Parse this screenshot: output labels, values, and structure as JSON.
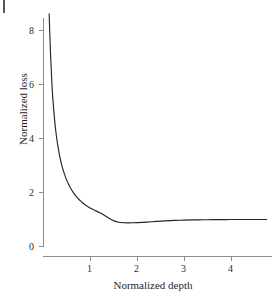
{
  "figure": {
    "background_color": "#ffffff",
    "line_color": "#262626",
    "axis_color": "#8c8c8c",
    "corner_mark_name": "page-margin-mark"
  },
  "chart_data": {
    "type": "line",
    "title": "",
    "xlabel": "Normalized depth",
    "ylabel": "Normalized loss",
    "xlim": [
      0.12,
      4.75
    ],
    "ylim": [
      0,
      9.1
    ],
    "xticks": [
      1,
      2,
      3,
      4
    ],
    "yticks": [
      0,
      2,
      4,
      6,
      8
    ],
    "xtick_labels": [
      "1",
      "2",
      "3",
      "4"
    ],
    "ytick_labels": [
      "0",
      "2",
      "4",
      "6",
      "8"
    ],
    "grid": false,
    "legend": null,
    "series": [
      {
        "name": "normalized loss",
        "x": [
          0.12,
          0.15,
          0.18,
          0.2,
          0.25,
          0.3,
          0.35,
          0.4,
          0.45,
          0.5,
          0.55,
          0.6,
          0.65,
          0.7,
          0.75,
          0.8,
          0.85,
          0.9,
          0.95,
          1.0,
          1.05,
          1.1,
          1.2,
          1.3,
          1.4,
          1.5,
          1.6,
          1.7,
          1.8,
          1.9,
          2.0,
          2.2,
          2.4,
          2.6,
          2.8,
          3.0,
          3.2,
          3.4,
          3.6,
          3.8,
          4.0,
          4.25,
          4.5,
          4.75
        ],
        "y": [
          8.62,
          7.1,
          6.0,
          5.45,
          4.45,
          3.78,
          3.3,
          2.94,
          2.66,
          2.43,
          2.25,
          2.09,
          1.96,
          1.85,
          1.75,
          1.67,
          1.59,
          1.53,
          1.47,
          1.42,
          1.37,
          1.33,
          1.25,
          1.15,
          1.04,
          0.95,
          0.9,
          0.88,
          0.875,
          0.878,
          0.885,
          0.905,
          0.93,
          0.95,
          0.965,
          0.978,
          0.985,
          0.99,
          0.993,
          0.996,
          0.998,
          0.999,
          1.0,
          1.0
        ]
      }
    ]
  }
}
